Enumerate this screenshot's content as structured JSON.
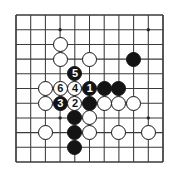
{
  "figure": {
    "kind": "go-board-diagram",
    "title": "",
    "board": {
      "columns": 11,
      "rows": 11,
      "line_color": "#3a3a3a",
      "edge_color": "#3a3a3a",
      "background": "#ffffff",
      "star_points": [
        {
          "col": 3,
          "row": 1
        },
        {
          "col": 9,
          "row": 1
        },
        {
          "col": 3,
          "row": 7
        },
        {
          "col": 9,
          "row": 7
        }
      ]
    },
    "stones": [
      {
        "col": 3,
        "row": 2,
        "color": "white",
        "label": ""
      },
      {
        "col": 3,
        "row": 3,
        "color": "white",
        "label": ""
      },
      {
        "col": 5,
        "row": 3,
        "color": "white",
        "label": ""
      },
      {
        "col": 8,
        "row": 3,
        "color": "black",
        "label": ""
      },
      {
        "col": 4,
        "row": 4,
        "color": "black",
        "label": "5"
      },
      {
        "col": 2,
        "row": 5,
        "color": "white",
        "label": ""
      },
      {
        "col": 3,
        "row": 5,
        "color": "white",
        "label": "6"
      },
      {
        "col": 4,
        "row": 5,
        "color": "white",
        "label": "4"
      },
      {
        "col": 5,
        "row": 5,
        "color": "black",
        "label": "1"
      },
      {
        "col": 6,
        "row": 5,
        "color": "black",
        "label": ""
      },
      {
        "col": 7,
        "row": 5,
        "color": "black",
        "label": ""
      },
      {
        "col": 2,
        "row": 6,
        "color": "white",
        "label": ""
      },
      {
        "col": 3,
        "row": 6,
        "color": "black",
        "label": "3"
      },
      {
        "col": 4,
        "row": 6,
        "color": "white",
        "label": "2"
      },
      {
        "col": 5,
        "row": 6,
        "color": "black",
        "label": ""
      },
      {
        "col": 6,
        "row": 6,
        "color": "white",
        "label": ""
      },
      {
        "col": 7,
        "row": 6,
        "color": "white",
        "label": ""
      },
      {
        "col": 8,
        "row": 6,
        "color": "white",
        "label": ""
      },
      {
        "col": 4,
        "row": 7,
        "color": "black",
        "label": ""
      },
      {
        "col": 5,
        "row": 7,
        "color": "white",
        "label": ""
      },
      {
        "col": 4,
        "row": 8,
        "color": "black",
        "label": ""
      },
      {
        "col": 5,
        "row": 8,
        "color": "white",
        "label": ""
      },
      {
        "col": 2,
        "row": 8,
        "color": "white",
        "label": ""
      },
      {
        "col": 7,
        "row": 8,
        "color": "white",
        "label": ""
      },
      {
        "col": 9,
        "row": 8,
        "color": "white",
        "label": ""
      },
      {
        "col": 4,
        "row": 9,
        "color": "black",
        "label": ""
      }
    ],
    "move_numbers": [
      "1",
      "2",
      "3",
      "4",
      "5",
      "6"
    ]
  }
}
